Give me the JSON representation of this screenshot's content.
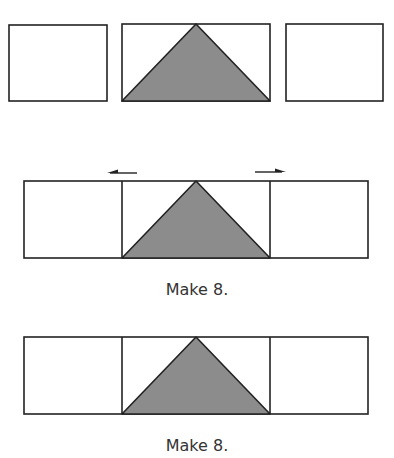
{
  "colors": {
    "stroke": "#222222",
    "triangle_fill": "#8c8c8c",
    "background": "#ffffff"
  },
  "step1": {
    "pieces": [
      "left-rectangle",
      "flying-geese-unit",
      "right-rectangle"
    ]
  },
  "step2": {
    "arrows": [
      "press-left-arrow",
      "press-right-arrow"
    ],
    "caption": "Make 8."
  },
  "step3": {
    "caption": "Make 8."
  }
}
